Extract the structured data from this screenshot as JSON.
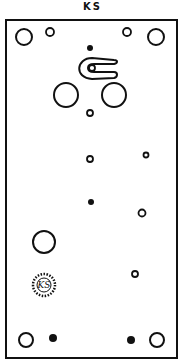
{
  "diagram": {
    "title": "KS",
    "colors": {
      "ink": "#111111",
      "paper": "#ffffff"
    },
    "frame": {
      "x": 6,
      "y": 20,
      "width": 171,
      "height": 338
    },
    "mounting_holes": [
      {
        "id": "top-left-large",
        "cx": 24,
        "cy": 37,
        "r": 8,
        "type": "ring"
      },
      {
        "id": "top-left-small",
        "cx": 50,
        "cy": 32,
        "r": 4,
        "type": "ring"
      },
      {
        "id": "top-right-small",
        "cx": 127,
        "cy": 32,
        "r": 4,
        "type": "ring"
      },
      {
        "id": "top-right-large",
        "cx": 156,
        "cy": 37,
        "r": 8,
        "type": "ring"
      },
      {
        "id": "bottom-left-ring",
        "cx": 26,
        "cy": 340,
        "r": 7,
        "type": "ring"
      },
      {
        "id": "bottom-left-dot",
        "cx": 53,
        "cy": 338,
        "r": 4,
        "type": "dot"
      },
      {
        "id": "bottom-right-dot",
        "cx": 131,
        "cy": 340,
        "r": 4,
        "type": "dot"
      },
      {
        "id": "bottom-right-ring",
        "cx": 157,
        "cy": 340,
        "r": 7,
        "type": "ring"
      }
    ],
    "interior_holes": [
      {
        "id": "top-center-dot",
        "cx": 90,
        "cy": 48,
        "r": 3,
        "type": "dot"
      },
      {
        "id": "left-large-hole",
        "cx": 66,
        "cy": 95,
        "r": 12,
        "type": "ring"
      },
      {
        "id": "right-large-hole",
        "cx": 114,
        "cy": 95,
        "r": 12,
        "type": "ring"
      },
      {
        "id": "center-small-1",
        "cx": 90,
        "cy": 113,
        "r": 3,
        "type": "ring"
      },
      {
        "id": "center-small-2",
        "cx": 90,
        "cy": 159,
        "r": 3,
        "type": "ring"
      },
      {
        "id": "right-small-1",
        "cx": 146,
        "cy": 155,
        "r": 2.5,
        "type": "ring"
      },
      {
        "id": "center-dot",
        "cx": 91,
        "cy": 202,
        "r": 3,
        "type": "dot"
      },
      {
        "id": "right-small-2",
        "cx": 142,
        "cy": 213,
        "r": 3.5,
        "type": "ring"
      },
      {
        "id": "lower-left-large",
        "cx": 44,
        "cy": 242,
        "r": 11,
        "type": "ring"
      },
      {
        "id": "right-small-3",
        "cx": 135,
        "cy": 274,
        "r": 3,
        "type": "ring"
      }
    ],
    "hook": {
      "inner_ring": {
        "cx": 92,
        "cy": 68,
        "r": 3
      }
    },
    "logo": {
      "text": "KS",
      "cx": 44,
      "cy": 285,
      "r": 11
    }
  }
}
